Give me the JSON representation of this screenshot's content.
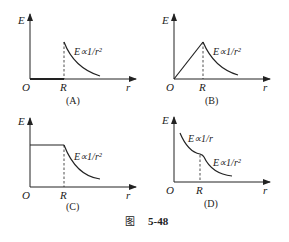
{
  "figure": {
    "caption_prefix": "图",
    "caption_number": "5-48"
  },
  "panels": [
    {
      "id": "A",
      "label": "(A)",
      "y_axis_label": "E",
      "x_axis_label": "r",
      "origin_label": "O",
      "r_label": "R",
      "formulas": [
        "E∝1/r²"
      ],
      "description": "E = 0 for r < R; E ∝ 1/r² for r > R (jump at R)"
    },
    {
      "id": "B",
      "label": "(B)",
      "y_axis_label": "E",
      "x_axis_label": "r",
      "origin_label": "O",
      "r_label": "R",
      "formulas": [
        "E∝1/r²"
      ],
      "description": "E rises linearly from 0 to R, then E ∝ 1/r²"
    },
    {
      "id": "C",
      "label": "(C)",
      "y_axis_label": "E",
      "x_axis_label": "r",
      "origin_label": "O",
      "r_label": "R",
      "formulas": [
        "E∝1/r²"
      ],
      "description": "E constant for r < R; E ∝ 1/r² for r > R"
    },
    {
      "id": "D",
      "label": "(D)",
      "y_axis_label": "E",
      "x_axis_label": "r",
      "origin_label": "O",
      "r_label": "R",
      "formulas": [
        "E∝1/r",
        "E∝1/r²"
      ],
      "description": "E ∝ 1/r for r < R; E ∝ 1/r² for r > R"
    }
  ]
}
